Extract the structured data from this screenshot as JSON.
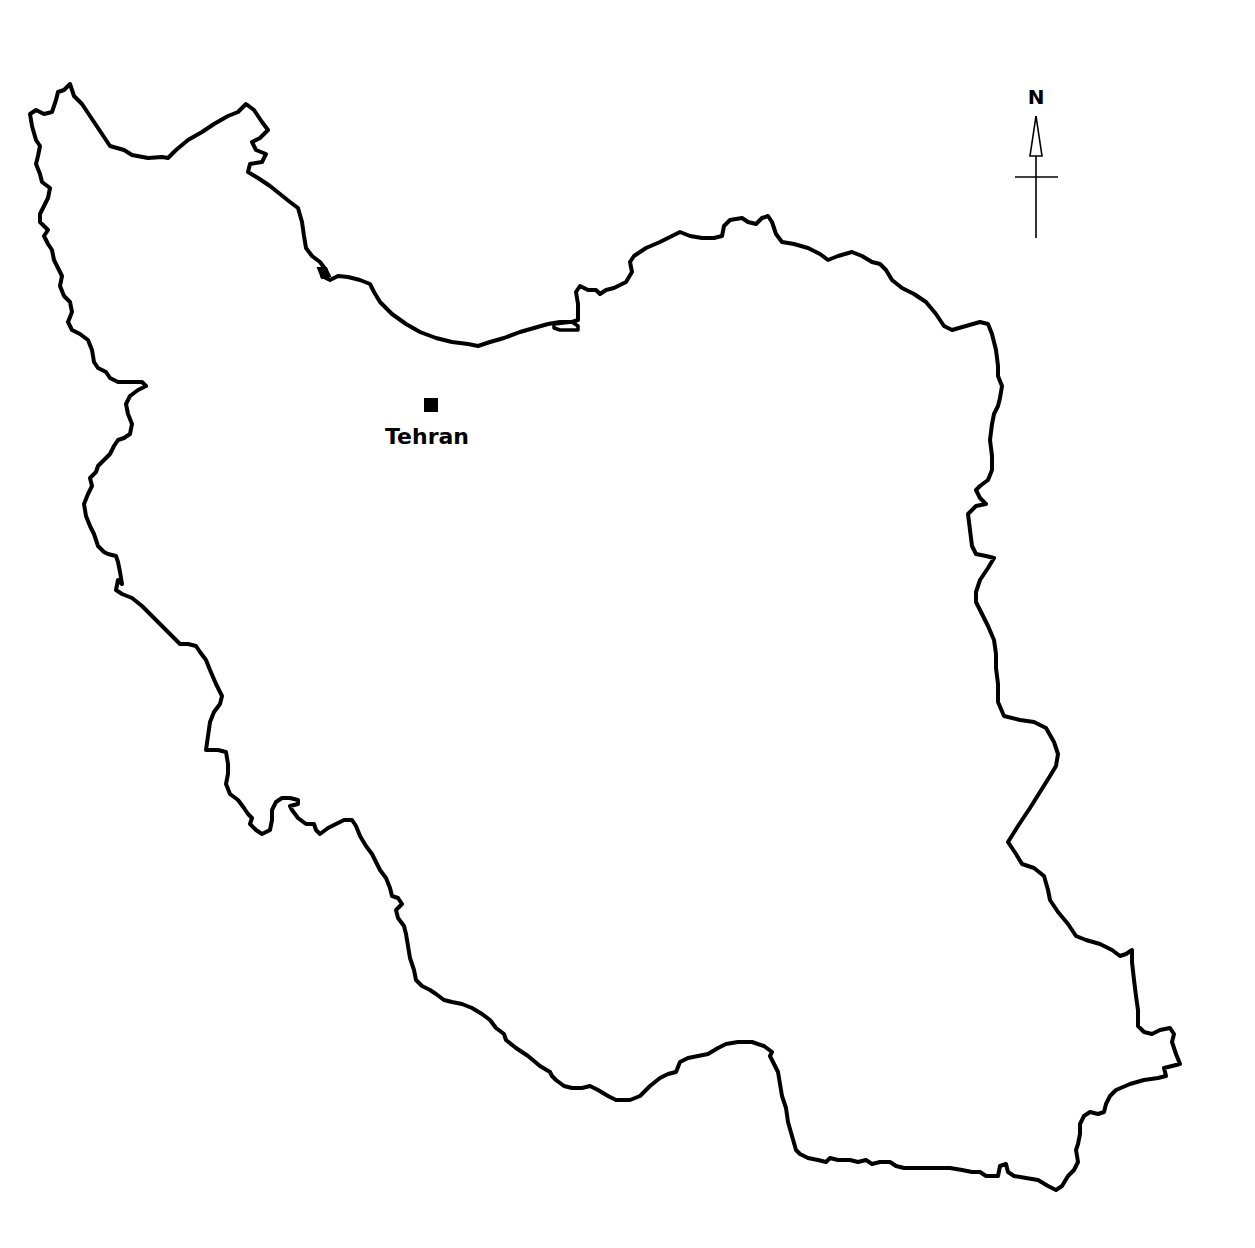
{
  "map": {
    "subject": "Iran country outline",
    "background_color": "#ffffff",
    "outline_color": "#000000",
    "cities": [
      {
        "name": "Tehran",
        "marker": "square",
        "marker_x": 430,
        "marker_y": 405,
        "label_x": 427,
        "label_y": 444
      }
    ],
    "north_arrow": {
      "label": "N",
      "x": 1036,
      "y_top": 115,
      "y_bottom": 238
    }
  }
}
